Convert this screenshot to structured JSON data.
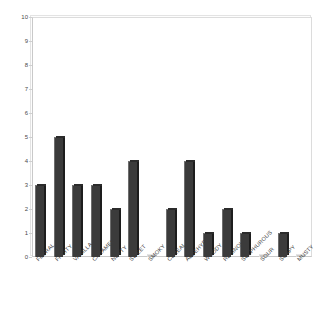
{
  "chart_data": {
    "type": "bar",
    "title": "",
    "subtitle": "",
    "xlabel": "",
    "ylabel": "",
    "ylim": [
      0,
      10
    ],
    "yticks": [
      0,
      1,
      2,
      3,
      4,
      5,
      6,
      7,
      8,
      9,
      10
    ],
    "ytick_labels": [
      "0",
      "1",
      "2",
      "3",
      "4",
      "5",
      "6",
      "7",
      "8",
      "9",
      "10"
    ],
    "grid": false,
    "legend": null,
    "legend_position": "none",
    "bar_color": "#3b3b3b",
    "frame_color": "#d0d0d0",
    "categories": [
      "FLORAL",
      "FRUITY",
      "VANILLA",
      "CARAMEL",
      "NUTTY",
      "SWEET",
      "SMOKY",
      "CEREAL",
      "ALDEHYDIC",
      "WOODY",
      "RESINOUS",
      "SULPHUROUS",
      "SOUR",
      "SOAPY",
      "MUSTY"
    ],
    "values": [
      3,
      5,
      3,
      3,
      2,
      4,
      0,
      2,
      4,
      1,
      2,
      1,
      0,
      1,
      0
    ]
  }
}
